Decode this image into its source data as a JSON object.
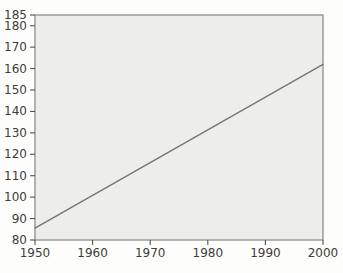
{
  "figure": {
    "background_color": "#fdfdfb",
    "plot_fill_color": "#ededeb",
    "frame_color": "#8f8f8c",
    "tick_color": "#55534e",
    "text_color": "#3e3d39",
    "line_color": "#767572"
  },
  "chart_data": {
    "type": "line",
    "title": "",
    "subtitle": "",
    "xlabel": "",
    "ylabel": "",
    "xlim": [
      1950,
      2000
    ],
    "ylim": [
      80,
      185
    ],
    "x_ticks": [
      1950,
      1960,
      1970,
      1980,
      1990,
      2000
    ],
    "y_ticks": [
      80,
      90,
      100,
      110,
      120,
      130,
      140,
      150,
      160,
      170,
      180,
      185
    ],
    "grid": false,
    "legend": false,
    "series": [
      {
        "name": "trend",
        "x": [
          1950,
          2000
        ],
        "y": [
          85.5,
          162
        ],
        "color": "#767572",
        "marker": "none"
      }
    ]
  }
}
